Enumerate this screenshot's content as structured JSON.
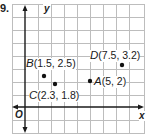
{
  "problem": {
    "number": "9."
  },
  "axes": {
    "x_label": "x",
    "y_label": "y",
    "origin_label": "O"
  },
  "points": [
    {
      "name": "A",
      "coords": "(5, 2)",
      "x": 5,
      "y": 2
    },
    {
      "name": "B",
      "coords": "(1.5, 2.5)",
      "x": 1.5,
      "y": 2.5
    },
    {
      "name": "C",
      "coords": "(2.3, 1.8)",
      "x": 2.3,
      "y": 1.8
    },
    {
      "name": "D",
      "coords": "(7.5, 3.2)",
      "x": 7.5,
      "y": 3.2
    }
  ],
  "grid": {
    "x_range": [
      -1,
      9
    ],
    "y_range": [
      -2,
      8
    ],
    "line_color": "#b8b8b8",
    "axis_color": "#1a1a1a"
  }
}
